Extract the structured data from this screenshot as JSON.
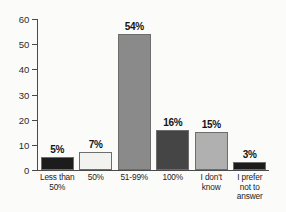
{
  "chart_data": {
    "type": "bar",
    "title": "",
    "subtitle": "",
    "xlabel": "",
    "ylabel": "",
    "ylim": [
      0,
      60
    ],
    "yticks": [
      0,
      10,
      20,
      30,
      40,
      50,
      60
    ],
    "ytick_labels": [
      "0",
      "10",
      "20",
      "30",
      "40",
      "50",
      "60"
    ],
    "grid": false,
    "legend": false,
    "categories": [
      "Less than 50%",
      "50%",
      "51-99%",
      "100%",
      "I don't know",
      "I prefer not to answer"
    ],
    "category_label_lines": [
      [
        "Less than",
        "50%"
      ],
      [
        "50%"
      ],
      [
        "51-99%"
      ],
      [
        "100%"
      ],
      [
        "I don't",
        "know"
      ],
      [
        "I prefer",
        "not to",
        "answer"
      ]
    ],
    "values": [
      5,
      7,
      54,
      16,
      15,
      3
    ],
    "data_labels": [
      "5%",
      "7%",
      "54%",
      "16%",
      "15%",
      "3%"
    ],
    "bar_colors": [
      "#1c1c1c",
      "#f2f2ee",
      "#8a8a8a",
      "#454545",
      "#b0b0b0",
      "#1c1c1c"
    ],
    "bar_border_color": "#6d6d6d",
    "axis_color": "#4a4a4a",
    "background_color": "#fbfbf9",
    "text_color": "#1a1a1a"
  }
}
